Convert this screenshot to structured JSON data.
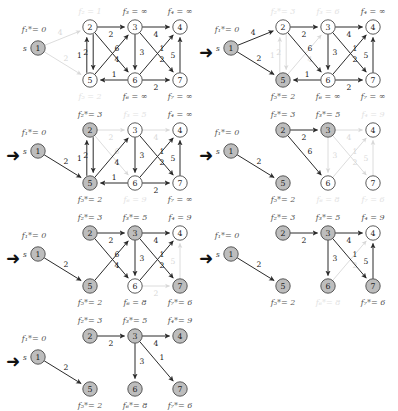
{
  "figure": {
    "node_ids": [
      "1",
      "2",
      "3",
      "4",
      "5",
      "6",
      "7"
    ],
    "source_marker": "s",
    "infinity": "∞",
    "step_arrow": "➜",
    "colors": {
      "active_stroke": "#2b2b2b",
      "faded_stroke": "#d8d8d8",
      "node_fill_settled": "#bdbdbd",
      "node_fill_open": "#ffffff",
      "label_active": "#555555",
      "label_faded": "#e2e2e2",
      "edge_weight": "#222222"
    },
    "edges": [
      {
        "from": "1",
        "to": "2",
        "w": "4"
      },
      {
        "from": "1",
        "to": "5",
        "w": "2"
      },
      {
        "from": "2",
        "to": "3",
        "w": "2"
      },
      {
        "from": "2",
        "to": "5",
        "w": "2"
      },
      {
        "from": "2",
        "to": "6",
        "w": "6"
      },
      {
        "from": "5",
        "to": "2",
        "w": "1"
      },
      {
        "from": "5",
        "to": "3",
        "w": "4"
      },
      {
        "from": "3",
        "to": "4",
        "w": "4"
      },
      {
        "from": "3",
        "to": "6",
        "w": "3"
      },
      {
        "from": "3",
        "to": "7",
        "w": "1"
      },
      {
        "from": "6",
        "to": "4",
        "w": "2"
      },
      {
        "from": "6",
        "to": "5",
        "w": "1"
      },
      {
        "from": "6",
        "to": "7",
        "w": "2"
      },
      {
        "from": "7",
        "to": "4",
        "w": "5"
      }
    ]
  },
  "panels": [
    {
      "id": "panel-1",
      "index": 1,
      "step_arrow": "",
      "labels": {
        "n1": {
          "text": "f₁*= 0",
          "state": "active"
        },
        "n2": {
          "text": "f₂ = 1",
          "state": "faded"
        },
        "n3": {
          "text": "f₃ = ∞",
          "state": "active"
        },
        "n4": {
          "text": "f₄ = ∞",
          "state": "active"
        },
        "n5": {
          "text": "f₅ = 2",
          "state": "faded"
        },
        "n6": {
          "text": "f₆ = ∞",
          "state": "active"
        },
        "n7": {
          "text": "f₇ = ∞",
          "state": "active"
        }
      },
      "settled": [
        "1"
      ],
      "faded_edges": [
        "1-2",
        "1-5"
      ],
      "hidden_edges": []
    },
    {
      "id": "panel-2",
      "index": 2,
      "step_arrow": "➜",
      "labels": {
        "n1": {
          "text": "f₁*= 0",
          "state": "active"
        },
        "n2": {
          "text": "f₂*= 3",
          "state": "faded"
        },
        "n3": {
          "text": "f₃ = 6",
          "state": "faded"
        },
        "n4": {
          "text": "f₄ = ∞",
          "state": "active"
        },
        "n5": {
          "text": "f₅*= 2",
          "state": "active"
        },
        "n6": {
          "text": "f₆ = ∞",
          "state": "active"
        },
        "n7": {
          "text": "f₇ = ∞",
          "state": "active"
        }
      },
      "settled": [
        "1",
        "5"
      ],
      "faded_edges": [
        "2-5",
        "5-2",
        "5-3"
      ],
      "hidden_edges": []
    },
    {
      "id": "panel-3",
      "index": 3,
      "step_arrow": "➜",
      "labels": {
        "n1": {
          "text": "f₁*= 0",
          "state": "active"
        },
        "n2": {
          "text": "f₂*= 3",
          "state": "active"
        },
        "n3": {
          "text": "f₃ = 5",
          "state": "faded"
        },
        "n4": {
          "text": "f₄ = ∞",
          "state": "active"
        },
        "n5": {
          "text": "f₅*= 2",
          "state": "active"
        },
        "n6": {
          "text": "f₆ = 9",
          "state": "faded"
        },
        "n7": {
          "text": "f₇ = ∞",
          "state": "active"
        }
      },
      "settled": [
        "1",
        "2",
        "5"
      ],
      "faded_edges": [
        "2-3",
        "2-6",
        "3-4"
      ],
      "hidden_edges": [
        "1-2"
      ]
    },
    {
      "id": "panel-4",
      "index": 4,
      "step_arrow": "➜",
      "labels": {
        "n1": {
          "text": "f₁*= 0",
          "state": "active"
        },
        "n2": {
          "text": "f₂*= 3",
          "state": "active"
        },
        "n3": {
          "text": "f₃*= 5",
          "state": "active"
        },
        "n4": {
          "text": "f₄ = 9",
          "state": "faded"
        },
        "n5": {
          "text": "f₅*= 2",
          "state": "active"
        },
        "n6": {
          "text": "f₆ = 8",
          "state": "faded"
        },
        "n7": {
          "text": "f₇ = 6",
          "state": "faded"
        }
      },
      "settled": [
        "1",
        "2",
        "3",
        "5"
      ],
      "faded_edges": [
        "3-4",
        "3-6",
        "3-7",
        "6-4",
        "7-4"
      ],
      "hidden_edges": [
        "1-2",
        "2-5",
        "5-2",
        "5-3",
        "6-5",
        "6-7"
      ]
    },
    {
      "id": "panel-5",
      "index": 5,
      "step_arrow": "➜",
      "labels": {
        "n1": {
          "text": "f₁*= 0",
          "state": "active"
        },
        "n2": {
          "text": "f₂*= 3",
          "state": "active"
        },
        "n3": {
          "text": "f₃*= 5",
          "state": "active"
        },
        "n4": {
          "text": "f₄ = 9",
          "state": "active"
        },
        "n5": {
          "text": "f₅*= 2",
          "state": "active"
        },
        "n6": {
          "text": "f₆ = 8",
          "state": "active"
        },
        "n7": {
          "text": "f₇*= 6",
          "state": "active"
        }
      },
      "settled": [
        "1",
        "2",
        "3",
        "5",
        "7"
      ],
      "faded_edges": [
        "7-4",
        "6-7"
      ],
      "hidden_edges": [
        "1-2",
        "2-5",
        "5-2",
        "6-5"
      ]
    },
    {
      "id": "panel-6",
      "index": 6,
      "step_arrow": "➜",
      "labels": {
        "n1": {
          "text": "f₁*= 0",
          "state": "active"
        },
        "n2": {
          "text": "f₂*= 3",
          "state": "active"
        },
        "n3": {
          "text": "f₃*= 5",
          "state": "active"
        },
        "n4": {
          "text": "f₄ = 9",
          "state": "active"
        },
        "n5": {
          "text": "f₅*= 2",
          "state": "active"
        },
        "n6": {
          "text": "f₆*= 8",
          "state": "faded"
        },
        "n7": {
          "text": "f₇*= 6",
          "state": "active"
        }
      },
      "settled": [
        "1",
        "2",
        "3",
        "5",
        "6",
        "7"
      ],
      "faded_edges": [
        "6-4"
      ],
      "hidden_edges": [
        "1-2",
        "2-5",
        "5-2",
        "5-3",
        "2-6",
        "6-5",
        "6-7"
      ]
    },
    {
      "id": "panel-7",
      "index": 7,
      "step_arrow": "➜",
      "labels": {
        "n1": {
          "text": "f₁*= 0",
          "state": "active"
        },
        "n2": {
          "text": "f₂*= 3",
          "state": "active"
        },
        "n3": {
          "text": "f₃*= 5",
          "state": "active"
        },
        "n4": {
          "text": "f₄*= 9",
          "state": "active"
        },
        "n5": {
          "text": "f₅*= 2",
          "state": "active"
        },
        "n6": {
          "text": "f₆*= 8",
          "state": "active"
        },
        "n7": {
          "text": "f₇*= 6",
          "state": "active"
        }
      },
      "settled": [
        "1",
        "2",
        "3",
        "4",
        "5",
        "6",
        "7"
      ],
      "faded_edges": [],
      "hidden_edges": [
        "1-2",
        "2-5",
        "5-2",
        "5-3",
        "2-6",
        "6-5",
        "6-7",
        "6-4",
        "7-4"
      ],
      "tree_only": true
    }
  ],
  "layout": {
    "panel_positions": [
      {
        "id": "panel-1",
        "left": 0,
        "top": 0
      },
      {
        "id": "panel-2",
        "left": 193,
        "top": 0
      },
      {
        "id": "panel-3",
        "left": 0,
        "top": 103
      },
      {
        "id": "panel-4",
        "left": 193,
        "top": 103
      },
      {
        "id": "panel-5",
        "left": 0,
        "top": 206
      },
      {
        "id": "panel-6",
        "left": 193,
        "top": 206
      },
      {
        "id": "panel-7",
        "left": 0,
        "top": 309
      }
    ]
  }
}
